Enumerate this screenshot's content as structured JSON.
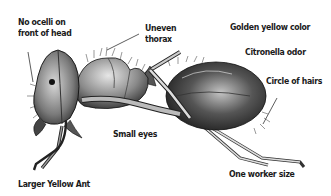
{
  "diagram": {
    "subject": "Larger Yellow Ant",
    "labels": {
      "ocelli": [
        "No ocelli on",
        "front of head"
      ],
      "thorax": [
        "Uneven",
        "thorax"
      ],
      "color": "Golden yellow color",
      "odor": "Citronella odor",
      "hairs": "Circle of hairs",
      "eyes": "Small eyes",
      "size": "One worker size",
      "title": "Larger Yellow Ant"
    },
    "colors": {
      "ink": "#1a1a1a",
      "background": "#ffffff"
    }
  }
}
